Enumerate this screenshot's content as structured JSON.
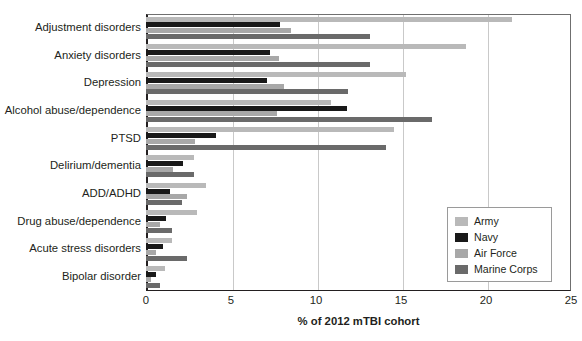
{
  "chart_data": {
    "type": "bar",
    "orientation": "horizontal",
    "title": "",
    "xlabel": "% of 2012 mTBI cohort",
    "ylabel": "",
    "xlim": [
      0,
      25
    ],
    "xticks": [
      0,
      5,
      10,
      15,
      20,
      25
    ],
    "xtick_labels": [
      "0",
      "5",
      "10",
      "15",
      "20",
      "25"
    ],
    "grid": "vertical",
    "legend_position": "inside-lower-right",
    "categories": [
      "Adjustment disorders",
      "Anxiety disorders",
      "Depression",
      "Alcohol abuse/dependence",
      "PTSD",
      "Delirium/dementia",
      "ADD/ADHD",
      "Drug abuse/dependence",
      "Acute stress disorders",
      "Bipolar disorder"
    ],
    "series": [
      {
        "name": "Army",
        "color": "#b9b9b9",
        "values": [
          21.5,
          18.8,
          15.3,
          10.9,
          14.6,
          2.8,
          3.5,
          3.0,
          1.5,
          1.1
        ]
      },
      {
        "name": "Navy",
        "color": "#191919",
        "values": [
          7.9,
          7.3,
          7.1,
          11.8,
          4.1,
          2.2,
          1.4,
          1.2,
          1.0,
          0.6
        ]
      },
      {
        "name": "Air Force",
        "color": "#a8a8a8",
        "values": [
          8.5,
          7.8,
          8.1,
          7.7,
          2.9,
          1.6,
          2.4,
          0.8,
          0.6,
          0.3
        ]
      },
      {
        "name": "Marine Corps",
        "color": "#6a6a6a",
        "values": [
          13.2,
          13.2,
          11.9,
          16.8,
          14.1,
          2.8,
          2.1,
          1.5,
          2.4,
          0.8
        ]
      }
    ]
  },
  "legend": {
    "items": [
      {
        "label": "Army",
        "color": "#b9b9b9"
      },
      {
        "label": "Navy",
        "color": "#191919"
      },
      {
        "label": "Air Force",
        "color": "#a8a8a8"
      },
      {
        "label": "Marine Corps",
        "color": "#6a6a6a"
      }
    ]
  }
}
